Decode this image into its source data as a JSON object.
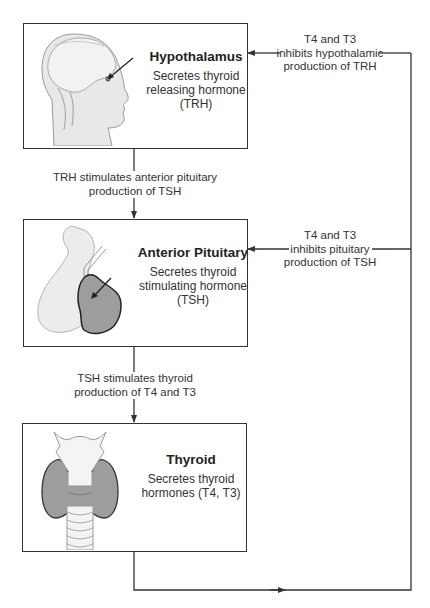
{
  "diagram": {
    "type": "flowchart",
    "nodes": [
      {
        "id": "hypothalamus",
        "title": "Hypothalamus",
        "description_lines": [
          "Secretes thyroid",
          "releasing hormone",
          "(TRH)"
        ],
        "illustration": "head-profile-with-brain"
      },
      {
        "id": "anterior_pituitary",
        "title": "Anterior Pituitary",
        "description_lines": [
          "Secretes thyroid",
          "stimulating hormone",
          "(TSH)"
        ],
        "illustration": "pituitary-gland"
      },
      {
        "id": "thyroid",
        "title": "Thyroid",
        "description_lines": [
          "Secretes thyroid",
          "hormones (T4, T3)"
        ],
        "illustration": "thyroid-gland-with-trachea"
      }
    ],
    "edges": [
      {
        "from": "hypothalamus",
        "to": "anterior_pituitary",
        "label_lines": [
          "TRH stimulates anterior pituitary",
          "production of TSH"
        ],
        "type": "stimulation"
      },
      {
        "from": "anterior_pituitary",
        "to": "thyroid",
        "label_lines": [
          "TSH stimulates thyroid",
          "production of T4 and T3"
        ],
        "type": "stimulation"
      },
      {
        "from": "thyroid",
        "to": "anterior_pituitary",
        "label_lines": [
          "T4 and T3",
          "inhibits pituitary",
          "production of TSH"
        ],
        "type": "negative-feedback"
      },
      {
        "from": "thyroid",
        "to": "hypothalamus",
        "label_lines": [
          "T4 and T3",
          "inhibits hypothalamic",
          "production of TRH"
        ],
        "type": "negative-feedback"
      }
    ]
  },
  "colors": {
    "line": "#333333",
    "text": "#333333",
    "illustration_light": "#e6e6e6",
    "illustration_dark": "#9a9a9a"
  }
}
